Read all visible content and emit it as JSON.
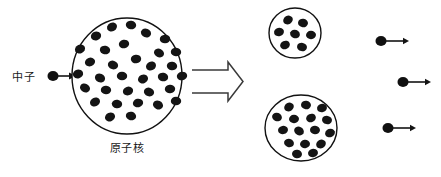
{
  "diagram": {
    "background_color": "#ffffff",
    "stroke_color": "#141414",
    "nucleon_color": "#141414",
    "arrow_color": "#3a3a3a",
    "width": 441,
    "height": 177
  },
  "labels": {
    "incoming_neutron": "中子",
    "target_nucleus": "原子核"
  },
  "chart_data": {
    "type": "diagram",
    "parent_nucleus": {
      "label": "原子核",
      "cx": 127,
      "cy": 76,
      "rx": 55,
      "ry": 58,
      "nucleon_count": 33,
      "nucleons": [
        [
          112,
          27
        ],
        [
          131,
          25
        ],
        [
          96,
          36
        ],
        [
          146,
          33
        ],
        [
          165,
          39
        ],
        [
          80,
          49
        ],
        [
          105,
          50
        ],
        [
          124,
          44
        ],
        [
          159,
          53
        ],
        [
          176,
          52
        ],
        [
          90,
          62
        ],
        [
          113,
          65
        ],
        [
          136,
          59
        ],
        [
          151,
          66
        ],
        [
          172,
          66
        ],
        [
          78,
          74
        ],
        [
          100,
          78
        ],
        [
          122,
          76
        ],
        [
          143,
          79
        ],
        [
          163,
          77
        ],
        [
          182,
          76
        ],
        [
          85,
          88
        ],
        [
          106,
          90
        ],
        [
          128,
          91
        ],
        [
          149,
          92
        ],
        [
          170,
          89
        ],
        [
          95,
          102
        ],
        [
          117,
          104
        ],
        [
          138,
          103
        ],
        [
          158,
          105
        ],
        [
          176,
          101
        ],
        [
          110,
          117
        ],
        [
          131,
          116
        ]
      ]
    },
    "fragments": [
      {
        "id": "fragment-small",
        "cx": 295,
        "cy": 33,
        "rx": 26,
        "ry": 25,
        "nucleon_count": 7,
        "nucleons": [
          [
            288,
            20
          ],
          [
            303,
            23
          ],
          [
            279,
            32
          ],
          [
            295,
            34
          ],
          [
            311,
            35
          ],
          [
            285,
            45
          ],
          [
            302,
            47
          ]
        ]
      },
      {
        "id": "fragment-large",
        "cx": 301,
        "cy": 128,
        "rx": 36,
        "ry": 33,
        "nucleon_count": 16,
        "nucleons": [
          [
            289,
            107
          ],
          [
            306,
            105
          ],
          [
            322,
            108
          ],
          [
            277,
            117
          ],
          [
            294,
            119
          ],
          [
            311,
            118
          ],
          [
            327,
            120
          ],
          [
            283,
            130
          ],
          [
            299,
            131
          ],
          [
            315,
            130
          ],
          [
            330,
            133
          ],
          [
            289,
            143
          ],
          [
            305,
            144
          ],
          [
            321,
            144
          ],
          [
            297,
            154
          ],
          [
            313,
            153
          ]
        ]
      }
    ],
    "incoming_neutron": {
      "label": "中子",
      "label_x": 12,
      "label_y": 81,
      "ball_cx": 53,
      "ball_cy": 76,
      "ball_r": 5,
      "arrow_from_x": 58,
      "arrow_to_x": 76,
      "arrow_y": 76
    },
    "emitted_neutrons": [
      {
        "id": "emitted-neutron-1",
        "ball_cx": 381,
        "ball_cy": 41,
        "ball_r": 5,
        "arrow_from_x": 386,
        "arrow_to_x": 409,
        "arrow_y": 41
      },
      {
        "id": "emitted-neutron-2",
        "ball_cx": 403,
        "ball_cy": 82,
        "ball_r": 5,
        "arrow_from_x": 408,
        "arrow_to_x": 431,
        "arrow_y": 82
      },
      {
        "id": "emitted-neutron-3",
        "ball_cx": 388,
        "ball_cy": 128,
        "ball_r": 5,
        "arrow_from_x": 393,
        "arrow_to_x": 416,
        "arrow_y": 128
      }
    ],
    "process_arrow": {
      "id": "fission-arrow",
      "x_start": 192,
      "x_body_end": 226,
      "x_tip": 243,
      "y_top": 70,
      "y_bottom": 93,
      "y_head_top": 62,
      "y_head_bottom": 101,
      "style": "hollow-open-arrow"
    }
  }
}
